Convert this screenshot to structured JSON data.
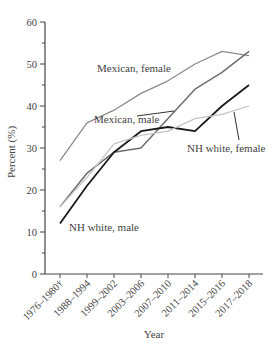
{
  "chart_data": {
    "type": "line",
    "title": "",
    "xlabel": "Year",
    "ylabel": "Percent (%)",
    "ylim": [
      0,
      60
    ],
    "yticks": [
      0,
      10,
      20,
      30,
      40,
      50,
      60
    ],
    "grid": false,
    "legend": "inline labels",
    "categories": [
      "1976–1980†",
      "1988–1994",
      "1999–2002",
      "2003–2006",
      "2007–2010",
      "2011–2014",
      "2015–2016",
      "2017–2018"
    ],
    "series": [
      {
        "name": "Mexican, female",
        "color": "#8c8c8c",
        "values": [
          27,
          36,
          39,
          43,
          46,
          50,
          53,
          52
        ]
      },
      {
        "name": "Mexican, male",
        "color": "#6e6e6e",
        "values": [
          16,
          24,
          29,
          30,
          37,
          44,
          48,
          53
        ]
      },
      {
        "name": "NH white, male",
        "color": "#1a1a1a",
        "values": [
          12,
          21,
          29,
          34,
          35,
          34,
          40,
          45
        ]
      },
      {
        "name": "NH white, female",
        "color": "#c4c4c4",
        "values": [
          16,
          23,
          31,
          33,
          34,
          37,
          38,
          40
        ]
      }
    ],
    "annotations": [
      {
        "text": "Mexican, female",
        "series": "Mexican, female"
      },
      {
        "text": "Mexican, male",
        "series": "Mexican, male"
      },
      {
        "text": "NH white, female",
        "series": "NH white, female"
      },
      {
        "text": "NH white, male",
        "series": "NH white, male"
      }
    ]
  }
}
